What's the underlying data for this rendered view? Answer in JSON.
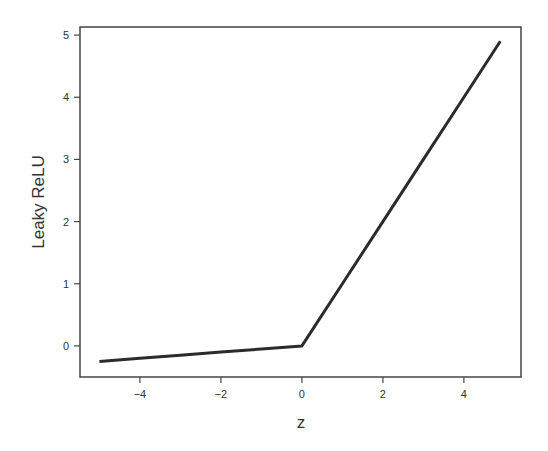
{
  "chart_data": {
    "type": "line",
    "title": "",
    "xlabel": "z",
    "ylabel": "Leaky ReLU",
    "xlim": [
      -5.48,
      5.41
    ],
    "ylim": [
      -0.5,
      5.13
    ],
    "xticks": [
      -4,
      -2,
      0,
      2,
      4
    ],
    "yticks": [
      0,
      1,
      2,
      3,
      4,
      5
    ],
    "xtick_labels": [
      "−4",
      "−2",
      "0",
      "2",
      "4"
    ],
    "ytick_labels": [
      "0",
      "1",
      "2",
      "3",
      "4",
      "5"
    ],
    "grid": false,
    "legend": null,
    "series": [
      {
        "name": "Leaky ReLU",
        "color": "#2b2b2b",
        "x": [
          -5.0,
          -4.0,
          -3.0,
          -2.0,
          -1.0,
          0.0,
          1.0,
          2.0,
          3.0,
          4.0,
          4.9
        ],
        "y": [
          -0.25,
          -0.2,
          -0.15,
          -0.1,
          -0.05,
          0.0,
          1.0,
          2.0,
          3.0,
          4.0,
          4.9
        ]
      }
    ],
    "annotations": []
  },
  "layout": {
    "frame_color": "#444444",
    "line_color": "#2b2b2b"
  }
}
